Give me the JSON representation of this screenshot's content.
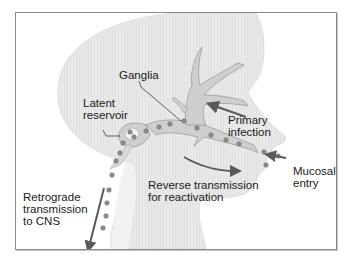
{
  "diagram": {
    "type": "anatomical-pathway",
    "labels": {
      "ganglia": "Ganglia",
      "latent_reservoir_line1": "Latent",
      "latent_reservoir_line2": "reservoir",
      "primary_infection_line1": "Primary",
      "primary_infection_line2": "infection",
      "mucosal_entry_line1": "Mucosal",
      "mucosal_entry_line2": "entry",
      "reverse_transmission_line1": "Reverse transmission",
      "reverse_transmission_line2": "for reactivation",
      "retrograde_line1": "Retrograde",
      "retrograde_line2": "transmission",
      "retrograde_line3": "to CNS"
    },
    "arrows": [
      {
        "name": "primary-infection-arrow",
        "direction": "toward ganglia (up-left)"
      },
      {
        "name": "mucosal-entry-arrow",
        "direction": "toward mouth (left)"
      },
      {
        "name": "reverse-transmission-arrow",
        "direction": "from ganglia toward mouth (down-right, curved)"
      },
      {
        "name": "retrograde-arrow",
        "direction": "down along spinal cord"
      }
    ],
    "colors": {
      "head_fill": "#e6e6e6",
      "nerve_fill": "#cfcfcf",
      "nerve_stroke": "#9a9a9a",
      "virion": "#8c8c8c",
      "arrow": "#5a5a5a",
      "frame": "#8a8a8a",
      "text": "#1a1a1a"
    }
  }
}
